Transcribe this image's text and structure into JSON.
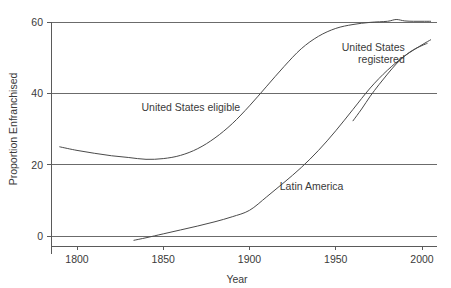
{
  "chart_data": {
    "type": "line",
    "title": "",
    "xlabel": "Year",
    "ylabel": "Proportion Enfranchised",
    "xlim": [
      1785,
      2008
    ],
    "ylim": [
      -3,
      62
    ],
    "xticks": [
      1800,
      1850,
      1900,
      1950,
      2000
    ],
    "xtick_labels": [
      "1800",
      "1850",
      "1900",
      "1950",
      "2000"
    ],
    "yticks": [
      0,
      20,
      40,
      60
    ],
    "ytick_labels": [
      "0",
      "20",
      "40",
      "60"
    ],
    "grid": "horizontal",
    "legend": "inline-labels",
    "series": [
      {
        "name": "United States eligible",
        "label": "United States eligible",
        "label_x": 1866,
        "label_y": 35,
        "label_anchor": "middle",
        "x": [
          1790,
          1800,
          1810,
          1820,
          1830,
          1840,
          1850,
          1860,
          1870,
          1880,
          1890,
          1900,
          1910,
          1920,
          1930,
          1940,
          1950,
          1960,
          1970,
          1980,
          1985,
          1990,
          1995,
          2000,
          2005
        ],
        "y": [
          25.0,
          24.0,
          23.2,
          22.5,
          22.0,
          21.5,
          21.7,
          22.6,
          24.5,
          27.5,
          31.5,
          36.5,
          42.0,
          47.5,
          52.5,
          56.0,
          58.2,
          59.3,
          59.9,
          60.2,
          60.7,
          60.3,
          60.2,
          60.2,
          60.2
        ]
      },
      {
        "name": "Latin America",
        "label": "Latin America",
        "label_x": 1936,
        "label_y": 13,
        "label_anchor": "middle",
        "x": [
          1833,
          1840,
          1850,
          1860,
          1870,
          1880,
          1890,
          1900,
          1910,
          1920,
          1930,
          1940,
          1950,
          1960,
          1970,
          1980,
          1990,
          2000,
          2005
        ],
        "y": [
          -1.2,
          -0.5,
          0.6,
          1.7,
          2.8,
          4.0,
          5.4,
          7.2,
          11.0,
          15.0,
          19.2,
          24.0,
          29.5,
          35.5,
          41.5,
          46.5,
          50.5,
          53.6,
          55.0
        ]
      },
      {
        "name": "United States registered",
        "label": "United States registered",
        "label_x": 1990,
        "label_y": 52,
        "label_anchor": "end",
        "x": [
          1960,
          1965,
          1970,
          1975,
          1980,
          1985,
          1990,
          1995,
          2000,
          2003
        ],
        "y": [
          32.3,
          35.6,
          39.2,
          42.4,
          45.4,
          48.2,
          50.5,
          52.2,
          53.4,
          54.0
        ]
      }
    ]
  },
  "colors": {
    "background": "#ffffff",
    "line": "#4a4a4a",
    "grid": "#6b6b6b",
    "axis": "#5a5a5a",
    "text": "#3a3a3a"
  }
}
